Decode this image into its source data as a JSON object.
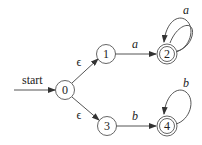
{
  "diagram": {
    "type": "nfa",
    "start_label": "start",
    "states": [
      {
        "id": "0",
        "label": "0",
        "accepting": false,
        "start": true
      },
      {
        "id": "1",
        "label": "1",
        "accepting": false
      },
      {
        "id": "2",
        "label": "2",
        "accepting": true
      },
      {
        "id": "3",
        "label": "3",
        "accepting": false
      },
      {
        "id": "4",
        "label": "4",
        "accepting": true
      }
    ],
    "transitions": [
      {
        "from": "0",
        "to": "1",
        "label": "ϵ"
      },
      {
        "from": "0",
        "to": "3",
        "label": "ϵ"
      },
      {
        "from": "1",
        "to": "2",
        "label": "a"
      },
      {
        "from": "2",
        "to": "2",
        "label": "a"
      },
      {
        "from": "3",
        "to": "4",
        "label": "b"
      },
      {
        "from": "4",
        "to": "4",
        "label": "b"
      }
    ]
  }
}
